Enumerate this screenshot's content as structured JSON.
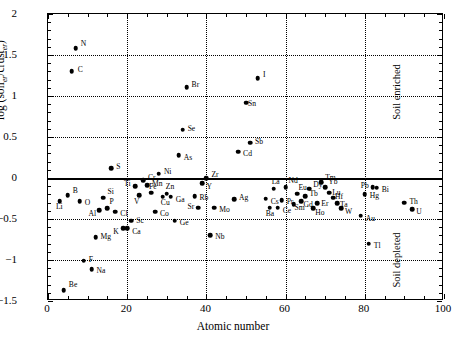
{
  "chart_data": {
    "type": "scatter",
    "title": "",
    "xlabel": "Atomic number",
    "ylabel": "log (soil_er/crust_er)",
    "ylabel_parts": {
      "prefix": "log (soil",
      "sub1": "er",
      "mid": "/crust",
      "sub2": "er",
      "suffix": ")"
    },
    "xlim": [
      0,
      100
    ],
    "ylim": [
      -1.5,
      2
    ],
    "xticks": [
      0,
      20,
      40,
      60,
      80,
      100
    ],
    "yticks": [
      -1.5,
      -1,
      -0.5,
      0,
      0.5,
      1,
      1.5,
      2
    ],
    "xtick_labels": [
      "0",
      "20",
      "40",
      "60",
      "80",
      "100"
    ],
    "ytick_labels": [
      "−1.5",
      "−1",
      "−0.5",
      "0",
      "0.5",
      "1",
      "1.5",
      "2"
    ],
    "grid": "dotted at major ticks",
    "reference_line": {
      "y": 0,
      "style": "solid thick"
    },
    "legend": "none",
    "annotations": [
      {
        "text": "Soil enriched",
        "x": 88,
        "y": 1.05,
        "rotation": -90
      },
      {
        "text": "Soil depleted",
        "x": 88,
        "y": -1.0,
        "rotation": -90
      }
    ],
    "points": [
      {
        "label": "Be",
        "x": 4,
        "y": -1.37,
        "lx": 5,
        "ly": -5
      },
      {
        "label": "Li",
        "x": 3,
        "y": -0.28,
        "lx": -4,
        "ly": 6
      },
      {
        "label": "B",
        "x": 5,
        "y": -0.21,
        "lx": 5,
        "ly": -4
      },
      {
        "label": "C",
        "x": 6,
        "y": 1.3,
        "lx": 6,
        "ly": -1
      },
      {
        "label": "N",
        "x": 7,
        "y": 1.58,
        "lx": 5,
        "ly": -4
      },
      {
        "label": "O",
        "x": 8,
        "y": -0.28,
        "lx": 5,
        "ly": 2
      },
      {
        "label": "F",
        "x": 9,
        "y": -1.01,
        "lx": 5,
        "ly": -1
      },
      {
        "label": "Na",
        "x": 11,
        "y": -1.11,
        "lx": 5,
        "ly": 2
      },
      {
        "label": "Mg",
        "x": 12,
        "y": -0.72,
        "lx": 5,
        "ly": 0
      },
      {
        "label": "Al",
        "x": 13,
        "y": -0.39,
        "lx": -11,
        "ly": 4
      },
      {
        "label": "Si",
        "x": 14,
        "y": -0.24,
        "lx": 0,
        "ly": -6
      },
      {
        "label": "P",
        "x": 15,
        "y": -0.37,
        "lx": 2,
        "ly": -6
      },
      {
        "label": "S",
        "x": 16,
        "y": 0.12,
        "lx": 5,
        "ly": -1
      },
      {
        "label": "Cl",
        "x": 17,
        "y": -0.41,
        "lx": 5,
        "ly": 2
      },
      {
        "label": "K",
        "x": 19,
        "y": -0.61,
        "lx": -10,
        "ly": 4
      },
      {
        "label": "Ca",
        "x": 20,
        "y": -0.61,
        "lx": 5,
        "ly": 4
      },
      {
        "label": "Sc",
        "x": 21,
        "y": -0.52,
        "lx": 5,
        "ly": 0
      },
      {
        "label": "Ti",
        "x": 22,
        "y": -0.1,
        "lx": -11,
        "ly": -2
      },
      {
        "label": "V",
        "x": 23,
        "y": -0.21,
        "lx": -5,
        "ly": 7
      },
      {
        "label": "Cr",
        "x": 24,
        "y": -0.03,
        "lx": 5,
        "ly": -2
      },
      {
        "label": "Mn",
        "x": 25,
        "y": -0.09,
        "lx": 5,
        "ly": -1
      },
      {
        "label": "Fe",
        "x": 26,
        "y": -0.18,
        "lx": -2,
        "ly": -6
      },
      {
        "label": "Co",
        "x": 27,
        "y": -0.41,
        "lx": 5,
        "ly": 2
      },
      {
        "label": "Ni",
        "x": 28,
        "y": 0.05,
        "lx": 5,
        "ly": -2
      },
      {
        "label": "Cu",
        "x": 29,
        "y": -0.23,
        "lx": -2,
        "ly": 6
      },
      {
        "label": "Zn",
        "x": 30,
        "y": -0.19,
        "lx": -1,
        "ly": -7
      },
      {
        "label": "Ga",
        "x": 31,
        "y": -0.23,
        "lx": 5,
        "ly": 3
      },
      {
        "label": "Ge",
        "x": 32,
        "y": -0.52,
        "lx": 5,
        "ly": 2
      },
      {
        "label": "As",
        "x": 33,
        "y": 0.28,
        "lx": 5,
        "ly": 3
      },
      {
        "label": "Se",
        "x": 34,
        "y": 0.59,
        "lx": 5,
        "ly": -1
      },
      {
        "label": "Br",
        "x": 35,
        "y": 1.11,
        "lx": 5,
        "ly": -2
      },
      {
        "label": "Rb",
        "x": 37,
        "y": -0.22,
        "lx": 5,
        "ly": 2
      },
      {
        "label": "Sr",
        "x": 38,
        "y": -0.36,
        "lx": -11,
        "ly": -1
      },
      {
        "label": "Y",
        "x": 39,
        "y": -0.06,
        "lx": 4,
        "ly": 4
      },
      {
        "label": "Zr",
        "x": 40,
        "y": 0.0,
        "lx": 5,
        "ly": -3
      },
      {
        "label": "Nb",
        "x": 41,
        "y": -0.7,
        "lx": 5,
        "ly": 2
      },
      {
        "label": "Mo",
        "x": 42,
        "y": -0.36,
        "lx": 5,
        "ly": 2
      },
      {
        "label": "Ag",
        "x": 47,
        "y": -0.26,
        "lx": 5,
        "ly": -1
      },
      {
        "label": "Cd",
        "x": 48,
        "y": 0.32,
        "lx": 5,
        "ly": 2
      },
      {
        "label": "Sn",
        "x": 50,
        "y": 0.92,
        "lx": 2,
        "ly": 1
      },
      {
        "label": "Sb",
        "x": 51,
        "y": 0.43,
        "lx": 5,
        "ly": -1
      },
      {
        "label": "I",
        "x": 53,
        "y": 1.22,
        "lx": 5,
        "ly": -3
      },
      {
        "label": "Cs",
        "x": 55,
        "y": -0.25,
        "lx": 5,
        "ly": 3
      },
      {
        "label": "Ba",
        "x": 56,
        "y": -0.36,
        "lx": -4,
        "ly": 6
      },
      {
        "label": "La",
        "x": 57,
        "y": -0.13,
        "lx": -2,
        "ly": -7
      },
      {
        "label": "Ce",
        "x": 58,
        "y": -0.36,
        "lx": 5,
        "ly": 3
      },
      {
        "label": "Pr",
        "x": 59,
        "y": -0.27,
        "lx": 5,
        "ly": 2
      },
      {
        "label": "Nd",
        "x": 60,
        "y": -0.11,
        "lx": 3,
        "ly": -6
      },
      {
        "label": "Sm",
        "x": 62,
        "y": -0.32,
        "lx": 1,
        "ly": 4
      },
      {
        "label": "Eu",
        "x": 63,
        "y": -0.19,
        "lx": 1,
        "ly": -6
      },
      {
        "label": "Gd",
        "x": 64,
        "y": -0.28,
        "lx": 2,
        "ly": 4
      },
      {
        "label": "Tb",
        "x": 65,
        "y": -0.22,
        "lx": 4,
        "ly": -2
      },
      {
        "label": "Dy",
        "x": 66,
        "y": -0.13,
        "lx": 4,
        "ly": -4
      },
      {
        "label": "Ho",
        "x": 67,
        "y": -0.37,
        "lx": 2,
        "ly": 5
      },
      {
        "label": "Er",
        "x": 68,
        "y": -0.31,
        "lx": 4,
        "ly": 1
      },
      {
        "label": "Tm",
        "x": 69,
        "y": -0.05,
        "lx": 4,
        "ly": -4
      },
      {
        "label": "Yb",
        "x": 70,
        "y": -0.11,
        "lx": 3,
        "ly": -5
      },
      {
        "label": "Lu",
        "x": 71,
        "y": -0.18,
        "lx": 3,
        "ly": 0
      },
      {
        "label": "Hf",
        "x": 72,
        "y": -0.24,
        "lx": 2,
        "ly": -1
      },
      {
        "label": "Ta",
        "x": 73,
        "y": -0.31,
        "lx": 3,
        "ly": 2
      },
      {
        "label": "W",
        "x": 74,
        "y": -0.37,
        "lx": 4,
        "ly": 4
      },
      {
        "label": "Au",
        "x": 79,
        "y": -0.46,
        "lx": 5,
        "ly": 3
      },
      {
        "label": "Hg",
        "x": 80,
        "y": -0.2,
        "lx": 5,
        "ly": 2
      },
      {
        "label": "Tl",
        "x": 81,
        "y": -0.8,
        "lx": 5,
        "ly": 2
      },
      {
        "label": "Pb",
        "x": 82,
        "y": -0.11,
        "lx": -12,
        "ly": -1
      },
      {
        "label": "Bi",
        "x": 83,
        "y": -0.12,
        "lx": 5,
        "ly": 2
      },
      {
        "label": "Th",
        "x": 90,
        "y": -0.3,
        "lx": 5,
        "ly": -1
      },
      {
        "label": "U",
        "x": 92,
        "y": -0.38,
        "lx": 4,
        "ly": 3
      }
    ]
  }
}
